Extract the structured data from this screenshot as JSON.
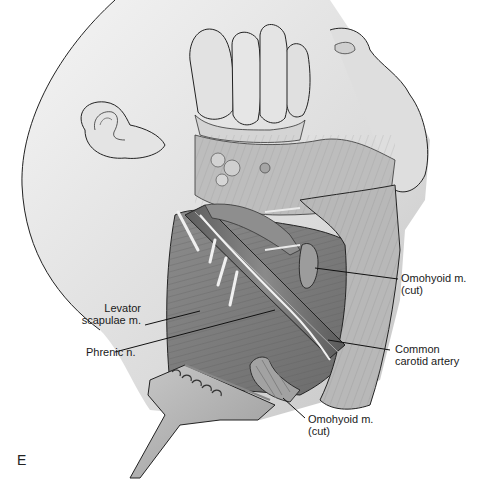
{
  "figure": {
    "panel_letter": "E",
    "palette": {
      "background": "#ffffff",
      "skin_light": "#e9e9e9",
      "skin_mid": "#c9c9c9",
      "muscle_dark": "#7a7a7a",
      "muscle_mid": "#9b9b9b",
      "artery": "#6e6e6e",
      "nerve": "#f2f2f2",
      "outline": "#222222",
      "leader": "#111111"
    }
  },
  "labels": {
    "omohyoid_upper": {
      "line1": "Omohyoid m.",
      "line2": "(cut)"
    },
    "levator": {
      "line1": "Levator",
      "line2": "scapulae m."
    },
    "phrenic": {
      "line1": "Phrenic n."
    },
    "carotid": {
      "line1": "Common",
      "line2": "carotid artery"
    },
    "omohyoid_lower": {
      "line1": "Omohyoid m.",
      "line2": "(cut)"
    }
  }
}
